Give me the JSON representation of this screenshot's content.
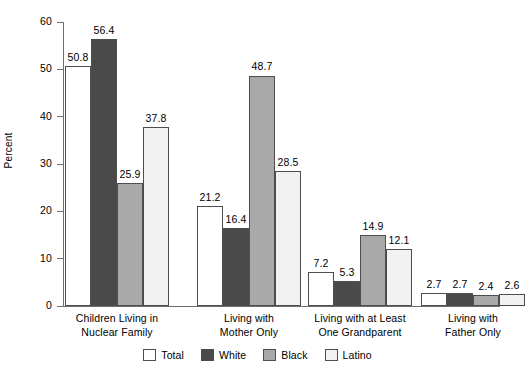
{
  "chart_data": {
    "type": "bar",
    "title": "",
    "xlabel": "",
    "ylabel": "Percent",
    "ylim": [
      0,
      60
    ],
    "yticks": [
      0,
      10,
      20,
      30,
      40,
      50,
      60
    ],
    "ytick_labels": [
      "0",
      "10",
      "20",
      "30",
      "40",
      "50",
      "60"
    ],
    "grid": false,
    "legend_position": "bottom-center",
    "categories": [
      "Children Living in\nNuclear Family",
      "Living with\nMother Only",
      "Living with at Least\nOne Grandparent",
      "Living with\nFather Only"
    ],
    "series": [
      {
        "name": "Total",
        "color": "#ffffff",
        "values": [
          50.8,
          21.2,
          7.2,
          2.7
        ],
        "labels": [
          "50.8",
          "21.2",
          "7.2",
          "2.7"
        ]
      },
      {
        "name": "White",
        "color": "#4a4a4a",
        "values": [
          56.4,
          16.4,
          5.3,
          2.7
        ],
        "labels": [
          "56.4",
          "16.4",
          "5.3",
          "2.7"
        ]
      },
      {
        "name": "Black",
        "color": "#a9a9a9",
        "values": [
          25.9,
          48.7,
          14.9,
          2.4
        ],
        "labels": [
          "25.9",
          "48.7",
          "14.9",
          "2.4"
        ]
      },
      {
        "name": "Latino",
        "color": "#f2f2f2",
        "values": [
          37.8,
          28.5,
          12.1,
          2.6
        ],
        "labels": [
          "37.8",
          "28.5",
          "12.1",
          "2.6"
        ]
      }
    ]
  },
  "legend": {
    "items": [
      {
        "label": "Total",
        "color": "#ffffff"
      },
      {
        "label": "White",
        "color": "#4a4a4a"
      },
      {
        "label": "Black",
        "color": "#a9a9a9"
      },
      {
        "label": "Latino",
        "color": "#f2f2f2"
      }
    ]
  },
  "axis": {
    "y_title": "Percent",
    "line_color": "#6d6d6d"
  }
}
